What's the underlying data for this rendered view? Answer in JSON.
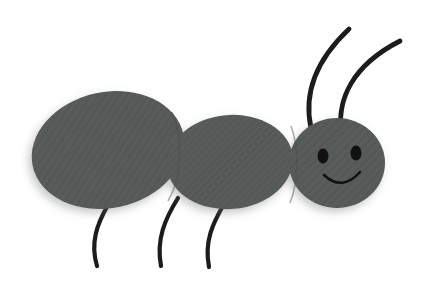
{
  "artwork": {
    "title": "Cartoon Ant",
    "subject": "ant",
    "style": "flat cartoon clip art with textured fill",
    "background_color": "#ffffff",
    "body_color": "#565a58",
    "body_shadow_color": "#4a4d4c",
    "outline_color": "#1c1c1c",
    "eye_color": "#111111",
    "mouth_color": "#111111",
    "canvas": {
      "width": 422,
      "height": 297
    }
  },
  "parts": {
    "abdomen": {
      "label": "Abdomen",
      "shape": "ellipse",
      "cx": 108,
      "cy": 150,
      "rx": 77,
      "ry": 58,
      "rotation": -12
    },
    "thorax": {
      "label": "Thorax",
      "shape": "ellipse",
      "cx": 230,
      "cy": 162,
      "rx": 63,
      "ry": 47,
      "rotation": -5
    },
    "head": {
      "label": "Head",
      "shape": "ellipse",
      "cx": 337,
      "cy": 163,
      "rx": 48,
      "ry": 45,
      "rotation": 0
    },
    "eye_left": {
      "label": "Left eye",
      "cx": 323,
      "cy": 156,
      "rx": 5.5,
      "ry": 7.5
    },
    "eye_right": {
      "label": "Right eye",
      "cx": 356,
      "cy": 153,
      "rx": 5.5,
      "ry": 7.5
    },
    "mouth": {
      "label": "Smile",
      "path": "M 324 175 Q 342 192 360 172"
    },
    "antenna_left": {
      "label": "Left antenna",
      "path": "M 311 124 C 305 96 314 62 349 29"
    },
    "antenna_right": {
      "label": "Right antenna",
      "path": "M 340 126 C 338 100 350 66 400 41"
    },
    "leg_front": {
      "label": "Front leg",
      "path": "M 224 204 C 213 223 204 241 209 267"
    },
    "leg_middle": {
      "label": "Middle leg",
      "path": "M 178 198 C 165 219 156 239 161 266"
    },
    "leg_rear": {
      "label": "Rear leg",
      "path": "M 108 205 C 97 224 90 243 97 266"
    }
  },
  "counts": {
    "body_segments": 3,
    "legs": 3,
    "antennae": 2,
    "eyes": 2
  }
}
